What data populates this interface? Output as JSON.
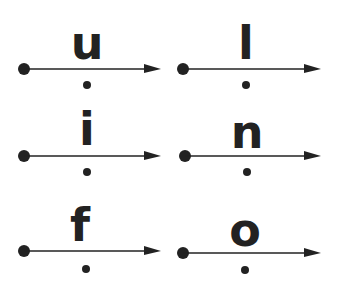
{
  "diagram": {
    "colors": {
      "ink": "#222222",
      "background": "#ffffff"
    },
    "cards": [
      {
        "letter": "u"
      },
      {
        "letter": "l"
      },
      {
        "letter": "i"
      },
      {
        "letter": "n"
      },
      {
        "letter": "f"
      },
      {
        "letter": "o"
      }
    ]
  }
}
